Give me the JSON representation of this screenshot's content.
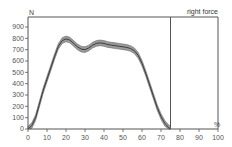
{
  "chart_data": {
    "type": "line",
    "title": "",
    "xlabel": "%",
    "ylabel": "N",
    "xlim": [
      0,
      100
    ],
    "ylim": [
      0,
      950
    ],
    "x_ticks": [
      0,
      10,
      20,
      30,
      40,
      50,
      60,
      70,
      80,
      90,
      100
    ],
    "y_ticks": [
      0,
      100,
      200,
      300,
      400,
      500,
      600,
      700,
      800,
      900
    ],
    "grid": false,
    "annotations": [
      {
        "text": "right force",
        "x": 100,
        "position": "top-right"
      }
    ],
    "vertical_marker_x": 75,
    "series": [
      {
        "name": "right force mean",
        "band": "±SD shaded gray",
        "x": [
          0,
          2,
          4,
          6,
          8,
          10,
          12,
          14,
          16,
          18,
          20,
          22,
          24,
          26,
          28,
          30,
          32,
          34,
          36,
          38,
          40,
          42,
          44,
          46,
          48,
          50,
          52,
          54,
          56,
          58,
          60,
          62,
          64,
          66,
          68,
          70,
          72,
          74,
          75
        ],
        "y": [
          0,
          30,
          100,
          220,
          340,
          440,
          540,
          640,
          730,
          780,
          795,
          785,
          755,
          725,
          705,
          700,
          715,
          740,
          755,
          760,
          755,
          745,
          740,
          735,
          730,
          725,
          720,
          710,
          690,
          650,
          580,
          490,
          390,
          290,
          190,
          110,
          50,
          12,
          0
        ],
        "band_width": 25
      }
    ]
  }
}
